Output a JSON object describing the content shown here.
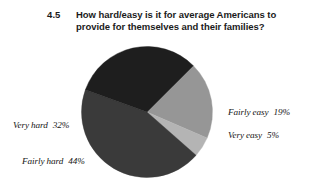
{
  "title": {
    "number": "4.5",
    "text": "How hard/easy is it for average Americans to provide for themselves and their families?"
  },
  "chart_data": {
    "type": "pie",
    "title": "How hard/easy is it for average Americans to provide for themselves and their families?",
    "categories": [
      "Fairly easy",
      "Very easy",
      "Fairly hard",
      "Very hard"
    ],
    "values": [
      19,
      5,
      44,
      32
    ],
    "value_unit": "%",
    "total": 100,
    "legend": "none",
    "labels_position": "outside",
    "start_angle_deg": 45,
    "direction": "clockwise",
    "slices": [
      {
        "label": "Fairly easy",
        "value": 19,
        "display": "19%",
        "color": "#969696"
      },
      {
        "label": "Very easy",
        "value": 5,
        "display": "5%",
        "color": "#b4b4b4"
      },
      {
        "label": "Fairly hard",
        "value": 44,
        "display": "44%",
        "color": "#3a3a3a"
      },
      {
        "label": "Very hard",
        "value": 32,
        "display": "32%",
        "color": "#1e1e1e"
      }
    ]
  },
  "labels": {
    "very_hard": {
      "name": "Very hard",
      "pct": "32%"
    },
    "fairly_hard": {
      "name": "Fairly hard",
      "pct": "44%"
    },
    "fairly_easy": {
      "name": "Fairly easy",
      "pct": "19%"
    },
    "very_easy": {
      "name": "Very easy",
      "pct": "5%"
    }
  }
}
